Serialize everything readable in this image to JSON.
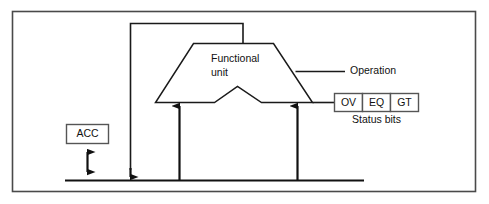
{
  "figure": {
    "type": "block-diagram",
    "width": 489,
    "height": 204,
    "background_color": "#ffffff",
    "line_color": "#1a1a1a",
    "frame_color": "#4a4a4a"
  },
  "blocks": {
    "functional_unit": {
      "label_line1": "Functional",
      "label_line2": "unit",
      "shape": "trapezoid-with-notch"
    },
    "accumulator": {
      "label": "ACC",
      "shape": "rectangle"
    },
    "status_bits": {
      "caption": "Status bits",
      "cells": [
        {
          "label": "OV"
        },
        {
          "label": "EQ"
        },
        {
          "label": "GT"
        }
      ]
    }
  },
  "labels": {
    "operation": "Operation"
  },
  "connections": [
    {
      "name": "result-feedback-to-bus",
      "from": "functional-unit-top",
      "to": "bus",
      "arrow": "single-down"
    },
    {
      "name": "bus-to-functional-unit-left-input",
      "from": "bus",
      "to": "functional-unit-bottom-left",
      "arrow": "single-up"
    },
    {
      "name": "bus-to-functional-unit-right-input",
      "from": "bus",
      "to": "functional-unit-bottom-right",
      "arrow": "single-up"
    },
    {
      "name": "accumulator-bus-bidirectional",
      "from": "accumulator",
      "to": "bus",
      "arrow": "double"
    },
    {
      "name": "operation-control-input",
      "from": "operation-label",
      "to": "functional-unit-right-edge",
      "arrow": "none"
    },
    {
      "name": "functional-unit-to-status-bits",
      "from": "functional-unit-bottom-right-corner",
      "to": "status-bits",
      "arrow": "none"
    }
  ]
}
